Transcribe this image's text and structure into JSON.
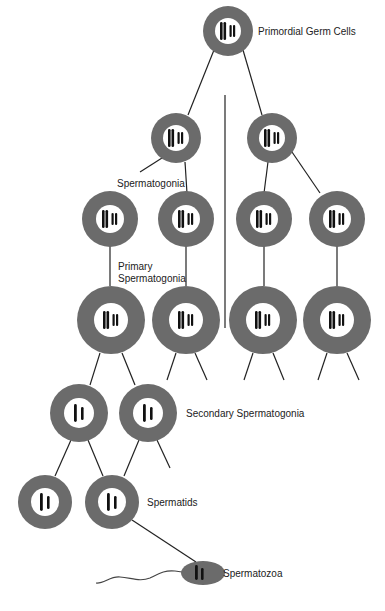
{
  "colors": {
    "ring": "#6b6b6b",
    "nucleus": "#ffffff",
    "chromosome": "#111111",
    "line": "#222222",
    "background": "#ffffff"
  },
  "labels": {
    "primordial": "Primordial Germ Cells",
    "spermatogonia": "Spermatogonia",
    "primary_line1": "Primary",
    "primary_line2": "Spermatogonia",
    "secondary": "Secondary Spermatogonia",
    "spermatids": "Spermatids",
    "spermatozoa": "Spermatozoa"
  },
  "stages": [
    {
      "name": "Primordial Germ Cells",
      "chromosomes": "4 (2 pairs)"
    },
    {
      "name": "Spermatogonia",
      "chromosomes": "4 (2 pairs)"
    },
    {
      "name": "Primary Spermatogonia",
      "chromosomes": "4 (2 pairs)"
    },
    {
      "name": "Secondary Spermatogonia",
      "chromosomes": "2"
    },
    {
      "name": "Spermatids",
      "chromosomes": "2"
    },
    {
      "name": "Spermatozoa",
      "chromosomes": "2"
    }
  ]
}
